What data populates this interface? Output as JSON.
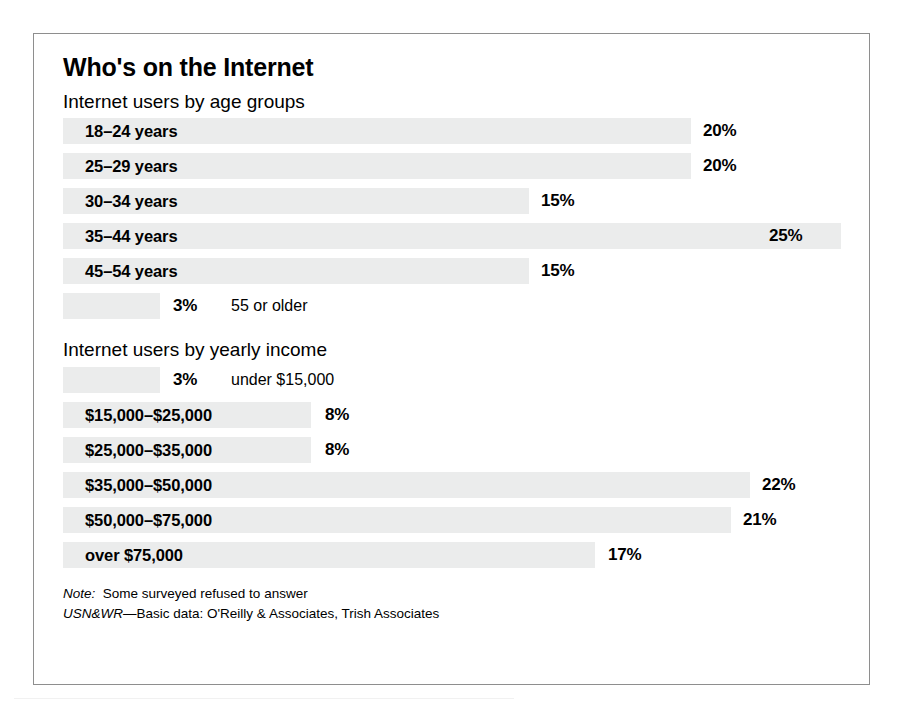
{
  "chart_data": {
    "type": "bar",
    "title": "Who's on the Internet",
    "xlabel": "",
    "ylabel": "",
    "xlim": [
      0,
      25
    ],
    "grid": false,
    "legend": null,
    "orientation": "horizontal",
    "value_suffix": "%",
    "sections": [
      {
        "label": "Internet users by age groups",
        "categories": [
          "18–24 years",
          "25–29 years",
          "30–34 years",
          "35–44 years",
          "45–54 years",
          "55 or older"
        ],
        "values": [
          20,
          20,
          15,
          25,
          15,
          3
        ],
        "value_labels": [
          "20%",
          "20%",
          "15%",
          "25%",
          "15%",
          "3%"
        ],
        "label_placement": [
          "inside",
          "inside",
          "inside",
          "inside",
          "inside",
          "outside"
        ]
      },
      {
        "label": "Internet users by yearly income",
        "categories": [
          "under $15,000",
          "$15,000–$25,000",
          "$25,000–$35,000",
          "$35,000–$50,000",
          "$50,000–$75,000",
          "over $75,000"
        ],
        "values": [
          3,
          8,
          8,
          22,
          21,
          17
        ],
        "value_labels": [
          "3%",
          "8%",
          "8%",
          "22%",
          "21%",
          "17%"
        ],
        "label_placement": [
          "outside",
          "inside",
          "inside",
          "inside",
          "inside",
          "inside"
        ]
      }
    ],
    "notes": [
      "Note: Some surveyed refused to answer",
      "USN&WR—Basic data: O'Reilly & Associates, Trish Associates"
    ]
  },
  "title": "Who's on the Internet",
  "age_section": {
    "label": "Internet users by age groups",
    "rows": [
      {
        "label": "18–24 years",
        "value": "20%",
        "bar_width_px": 628,
        "value_x_px": 640,
        "inside": true
      },
      {
        "label": "25–29 years",
        "value": "20%",
        "bar_width_px": 628,
        "value_x_px": 640,
        "inside": true
      },
      {
        "label": "30–34 years",
        "value": "15%",
        "bar_width_px": 466,
        "value_x_px": 478,
        "inside": true
      },
      {
        "label": "35–44 years",
        "value": "25%",
        "bar_width_px": 778,
        "value_x_px": 706,
        "inside": true
      },
      {
        "label": "45–54 years",
        "value": "15%",
        "bar_width_px": 466,
        "value_x_px": 478,
        "inside": true
      },
      {
        "label": "55 or older",
        "value": "3%",
        "bar_width_px": 97,
        "value_x_px": 110,
        "inside": false,
        "outside_label_x_px": 168
      }
    ]
  },
  "income_section": {
    "label": "Internet users by yearly income",
    "rows": [
      {
        "label": "under $15,000",
        "value": "3%",
        "bar_width_px": 97,
        "value_x_px": 110,
        "inside": false,
        "outside_label_x_px": 168
      },
      {
        "label": "$15,000–$25,000",
        "value": "8%",
        "bar_width_px": 248,
        "value_x_px": 262,
        "inside": true
      },
      {
        "label": "$25,000–$35,000",
        "value": "8%",
        "bar_width_px": 248,
        "value_x_px": 262,
        "inside": true
      },
      {
        "label": "$35,000–$50,000",
        "value": "22%",
        "bar_width_px": 687,
        "value_x_px": 699,
        "inside": true
      },
      {
        "label": "$50,000–$75,000",
        "value": "21%",
        "bar_width_px": 668,
        "value_x_px": 680,
        "inside": true
      },
      {
        "label": "over $75,000",
        "value": "17%",
        "bar_width_px": 532,
        "value_x_px": 545,
        "inside": true
      }
    ]
  },
  "footnotes": {
    "note_prefix": "Note:",
    "note_text": "Some surveyed refused to answer",
    "source_prefix": "USN&WR",
    "source_text": "—Basic data: O'Reilly & Associates, Trish Associates"
  },
  "colors": {
    "bar": "#ebecec",
    "frame_border": "#8e8e8e",
    "text": "#000000",
    "background": "#ffffff"
  }
}
